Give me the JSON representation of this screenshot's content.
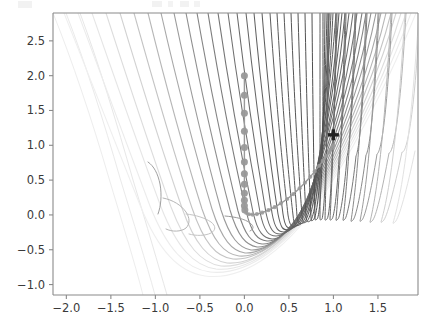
{
  "figure": {
    "background_color": "#ffffff",
    "axes_background_color": "#ffffff",
    "spine_color": "#8a8a8a",
    "tick_color": "#8a8a8a",
    "tick_label_color": "#3a3a3a"
  },
  "chart_data": {
    "type": "line",
    "title": "",
    "xlabel": "",
    "ylabel": "",
    "xlim": [
      -2.15,
      1.95
    ],
    "ylim": [
      -1.15,
      2.9
    ],
    "xticks": [
      -2.0,
      -1.5,
      -1.0,
      -0.5,
      0.0,
      0.5,
      1.0,
      1.5
    ],
    "xticklabels": [
      "−2.0",
      "−1.5",
      "−1.0",
      "−0.5",
      "0.0",
      "0.5",
      "1.0",
      "1.5"
    ],
    "yticks": [
      -1.0,
      -0.5,
      0.0,
      0.5,
      1.0,
      1.5,
      2.0,
      2.5
    ],
    "yticklabels": [
      "−1.0",
      "−0.5",
      "0.0",
      "0.5",
      "1.0",
      "1.5",
      "2.0",
      "2.5"
    ],
    "grid": false,
    "legend": null,
    "background_field": {
      "name": "rosenbrock-contours",
      "function": "(1 - x)^2 + 100*(y - x^2)^2",
      "contour_style": "line",
      "colormap": "gray",
      "levels": [
        0.5,
        1.5,
        3,
        6,
        12,
        22,
        40,
        70,
        120,
        200,
        320,
        500,
        800,
        1300,
        2000,
        3200,
        5000,
        8000
      ],
      "line_color_light": "#e8e8e8",
      "line_color_dark": "#5a5a5a"
    },
    "series": [
      {
        "name": "optimization-trajectory",
        "type": "line+markers",
        "line_color": "#999999",
        "marker_color": "#999999",
        "marker": "o",
        "marker_size": 7,
        "points": [
          [
            0.0,
            2.0
          ],
          [
            0.0,
            1.72
          ],
          [
            0.0,
            1.46
          ],
          [
            0.0,
            1.2
          ],
          [
            0.0,
            0.97
          ],
          [
            0.0,
            0.76
          ],
          [
            0.0,
            0.59
          ],
          [
            0.0,
            0.44
          ],
          [
            0.0,
            0.31
          ],
          [
            0.0,
            0.21
          ],
          [
            0.0,
            0.13
          ],
          [
            0.005,
            0.07
          ],
          [
            0.02,
            0.03
          ],
          [
            0.05,
            0.01
          ],
          [
            0.09,
            0.005
          ],
          [
            0.14,
            0.012
          ],
          [
            0.2,
            0.032
          ],
          [
            0.27,
            0.068
          ],
          [
            0.34,
            0.112
          ],
          [
            0.41,
            0.167
          ],
          [
            0.48,
            0.229
          ],
          [
            0.55,
            0.3
          ],
          [
            0.62,
            0.382
          ],
          [
            0.68,
            0.462
          ],
          [
            0.74,
            0.547
          ],
          [
            0.79,
            0.625
          ],
          [
            0.84,
            0.706
          ],
          [
            0.88,
            0.776
          ],
          [
            0.92,
            0.846
          ],
          [
            0.95,
            0.903
          ],
          [
            0.97,
            0.942
          ],
          [
            0.99,
            0.981
          ],
          [
            1.0,
            1.0
          ]
        ]
      }
    ],
    "annotations": [
      {
        "name": "optimum-marker",
        "label": "",
        "x": 1.0,
        "y": 1.15,
        "marker": "+",
        "color": "#222222",
        "size": 11
      }
    ]
  }
}
